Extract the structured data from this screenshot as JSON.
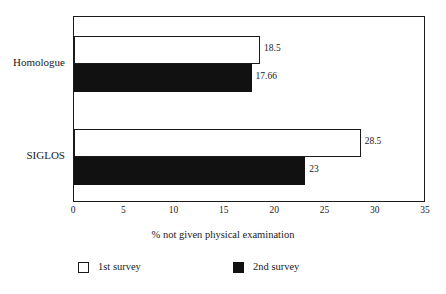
{
  "chart_data": {
    "type": "bar",
    "orientation": "horizontal",
    "title": "",
    "subtitle": "",
    "categories": [
      "Homologue",
      "SIGLOS"
    ],
    "series": [
      {
        "name": "1st survey",
        "values": [
          18.5,
          28.5
        ],
        "color": "#ffffff",
        "marker": "hollow-square"
      },
      {
        "name": "2nd survey",
        "values": [
          17.66,
          23
        ],
        "color": "#111111",
        "marker": "filled-square"
      }
    ],
    "value_labels": [
      [
        "18.5",
        "28.5"
      ],
      [
        "17.66",
        "23"
      ]
    ],
    "xlabel": "% not given physical examination",
    "ylabel": "",
    "xlim": [
      0,
      35
    ],
    "xticks": [
      0,
      5,
      10,
      15,
      20,
      25,
      30,
      35
    ],
    "xtick_labels": [
      "0",
      "5",
      "10",
      "15",
      "20",
      "25",
      "30",
      "35"
    ],
    "grid": false,
    "legend_position": "bottom",
    "frame": true,
    "background_color": "#ffffff",
    "axis_color": "#1a1a1a"
  },
  "axis": {
    "x_title": "% not given physical examination"
  },
  "legend": {
    "entries": [
      {
        "label": "1st survey"
      },
      {
        "label": "2nd survey"
      }
    ]
  }
}
